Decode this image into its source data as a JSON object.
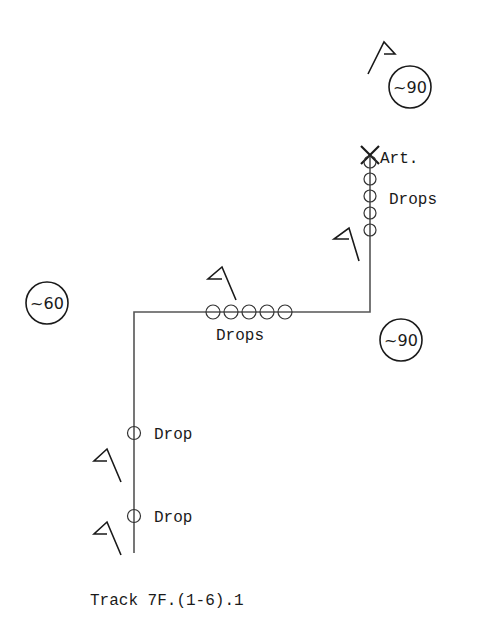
{
  "diagram": {
    "caption": "Track 7F.(1-6).1",
    "colors": {
      "ink": "#1a1a1a",
      "track": "#555555",
      "background": "#ffffff"
    },
    "track": {
      "path": [
        [
          134,
          553
        ],
        [
          134,
          312
        ],
        [
          370,
          312
        ],
        [
          370,
          155
        ]
      ]
    },
    "markers": {
      "article": {
        "label": "Art.",
        "symbol": "x-mark",
        "x": 370,
        "y": 155
      },
      "drops_upper": {
        "label": "Drops",
        "count": 5,
        "x": 370,
        "ys": [
          162,
          179,
          196,
          213,
          230
        ]
      },
      "drops_middle": {
        "label": "Drops",
        "count": 5,
        "y": 312,
        "xs": [
          214,
          232,
          250,
          268,
          286
        ]
      },
      "drop_lower_1": {
        "label": "Drop",
        "x": 134,
        "y": 433
      },
      "drop_lower_2": {
        "label": "Drop",
        "x": 134,
        "y": 516
      }
    },
    "bearings": [
      {
        "label": "~90",
        "cx": 410,
        "cy": 87
      },
      {
        "label": "~60",
        "cx": 47,
        "cy": 303
      },
      {
        "label": "~90",
        "cx": 401,
        "cy": 340
      }
    ],
    "flags": [
      {
        "id": "flag-top",
        "x": 370,
        "y": 42
      },
      {
        "id": "flag-upper-right",
        "x": 350,
        "y": 255
      },
      {
        "id": "flag-middle",
        "x": 222,
        "y": 270
      },
      {
        "id": "flag-lower-1",
        "x": 100,
        "y": 455
      },
      {
        "id": "flag-lower-2",
        "x": 100,
        "y": 525
      }
    ]
  },
  "labels": {
    "art": "Art.",
    "drops_upper": "Drops",
    "drops_middle": "Drops",
    "drop_1": "Drop",
    "drop_2": "Drop",
    "bearing_top": "~90",
    "bearing_left": "~60",
    "bearing_right": "~90",
    "caption": "Track 7F.(1-6).1"
  }
}
